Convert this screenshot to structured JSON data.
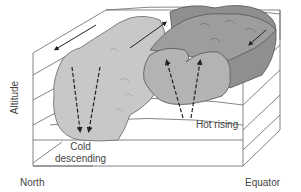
{
  "diagram": {
    "labels": {
      "north": "North",
      "equator": "Equator",
      "altitude": "Altitude",
      "cold_line1": "Cold",
      "cold_line2": "descending",
      "hot": "Hot rising"
    },
    "colors": {
      "box_line": "#555555",
      "cold_cell": "#c8c8c8",
      "hot_cell": "#a3a3a3",
      "hot_cell_top": "#8c8c8c",
      "arrow": "#222222",
      "text": "#444444"
    },
    "arrows": [
      {
        "name": "upper-flow-arrow",
        "direction": "toward North (top-left)"
      },
      {
        "name": "top-return-arrow",
        "direction": "toward Equator (up-right)"
      },
      {
        "name": "hot-cell-top-arrow",
        "direction": "down-left"
      },
      {
        "name": "cold-descending-arrows",
        "direction": "down"
      },
      {
        "name": "hot-rising-arrows",
        "direction": "up"
      }
    ]
  }
}
